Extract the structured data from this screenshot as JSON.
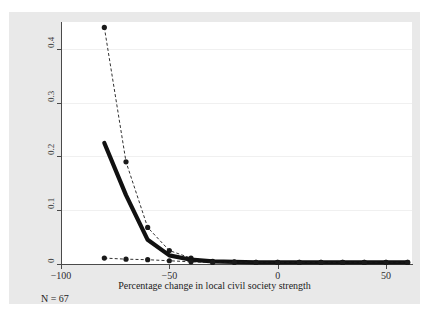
{
  "figure": {
    "scan_top_text": "",
    "scan_bottom_text": "",
    "note": "N = 67"
  },
  "axes": {
    "y_ticks": [
      "0",
      "0.1",
      "0.2",
      "0.3",
      "0.4"
    ],
    "x_ticks": [
      "-100",
      "-50",
      "0",
      "50"
    ],
    "x_title": "Percentage change in local civil society strength",
    "y_title": ""
  },
  "chart_data": {
    "type": "line",
    "title": "",
    "subtitle": "",
    "xlabel": "Percentage change in local civil society strength",
    "ylabel": "",
    "xlim": [
      -100,
      62
    ],
    "ylim": [
      0,
      0.45
    ],
    "grid": true,
    "legend": "none",
    "annotations": [
      "N = 67"
    ],
    "x": [
      -80,
      -70,
      -60,
      -50,
      -40,
      -30,
      -20,
      -10,
      0,
      10,
      20,
      30,
      40,
      50,
      60
    ],
    "series": [
      {
        "name": "upper-confidence-bound",
        "style": "dashed-with-markers",
        "color": "#1a1a1a",
        "values": [
          0.44,
          0.19,
          0.068,
          0.025,
          0.011,
          0.005,
          0.004,
          0.003,
          0.003,
          0.003,
          0.003,
          0.003,
          0.003,
          0.003,
          0.003
        ]
      },
      {
        "name": "point-estimate",
        "style": "thick-solid",
        "color": "#111111",
        "values": [
          0.225,
          0.128,
          0.045,
          0.016,
          0.008,
          0.005,
          0.004,
          0.003,
          0.003,
          0.003,
          0.003,
          0.003,
          0.003,
          0.003,
          0.003
        ]
      },
      {
        "name": "lower-confidence-bound",
        "style": "dashed-with-markers",
        "color": "#1a1a1a",
        "values": [
          0.011,
          0.009,
          0.008,
          0.006,
          0.004,
          0.003,
          0.003,
          0.003,
          0.003,
          0.003,
          0.003,
          0.003,
          0.003,
          0.003,
          0.003
        ]
      }
    ]
  }
}
